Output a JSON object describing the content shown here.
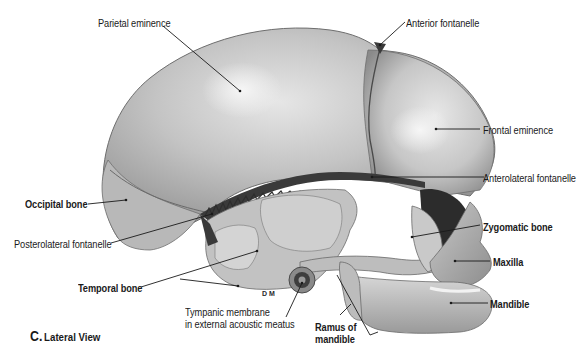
{
  "figure": {
    "caption_letter": "C.",
    "caption_text": "Lateral View",
    "colors": {
      "background": "#ffffff",
      "bone_light": "#d9d9d9",
      "bone_mid": "#b3b3b3",
      "bone_dark": "#7a7a7a",
      "fontanelle": "#3a3a3a",
      "leader_line": "#1a1a1a",
      "label_text": "#1a1a1a"
    }
  },
  "labels": {
    "parietal_eminence": "Parietal eminence",
    "anterior_fontanelle": "Anterior fontanelle",
    "frontal_eminence": "Frontal eminence",
    "anterolateral_fontanelle": "Anterolateral fontanelle",
    "occipital_bone": "Occipital bone",
    "posterolateral_fontanelle": "Posterolateral fontanelle",
    "zygomatic_bone": "Zygomatic bone",
    "maxilla": "Maxilla",
    "temporal_bone": "Temporal bone",
    "mandible": "Mandible",
    "tympanic_membrane_line1": "Tympanic membrane",
    "tympanic_membrane_line2": "in external acoustic meatus",
    "ramus_line1": "Ramus of",
    "ramus_line2": "mandible"
  },
  "signature": "D M"
}
